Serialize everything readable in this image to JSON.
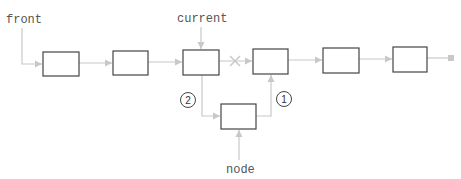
{
  "diagram": {
    "colors": {
      "line": "#c8c8c8",
      "box_border": "#444444",
      "box_fill": "#ffffff",
      "text": "#555555",
      "circle": "#444444"
    },
    "labels": {
      "front": "front",
      "current": "current",
      "node": "node"
    },
    "steps": [
      {
        "id": "step-1",
        "label": "1"
      },
      {
        "id": "step-2",
        "label": "2"
      }
    ],
    "nodes": [
      {
        "id": "n1",
        "x": 43,
        "y": 52,
        "w": 36,
        "h": 24
      },
      {
        "id": "n2",
        "x": 113,
        "y": 51,
        "w": 35,
        "h": 24
      },
      {
        "id": "n3-current",
        "x": 183,
        "y": 50,
        "w": 36,
        "h": 25
      },
      {
        "id": "n4",
        "x": 253,
        "y": 49,
        "w": 35,
        "h": 25
      },
      {
        "id": "n5",
        "x": 323,
        "y": 48,
        "w": 36,
        "h": 25
      },
      {
        "id": "n6",
        "x": 393,
        "y": 47,
        "w": 34,
        "h": 25
      },
      {
        "id": "new-node",
        "x": 221,
        "y": 104,
        "w": 35,
        "h": 25
      }
    ],
    "removed_link_marker": "×"
  }
}
